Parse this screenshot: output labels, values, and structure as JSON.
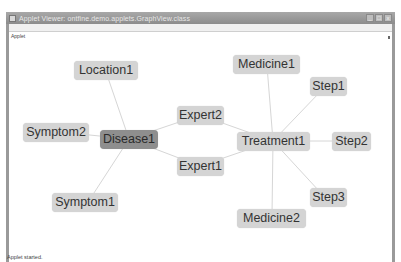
{
  "window": {
    "title": "Applet Viewer: ontfine.demo.applets.GraphView.class",
    "controls": {
      "minimize": "_",
      "maximize": "□",
      "close": "x"
    }
  },
  "menubar": {
    "items": [
      {
        "label": "Applet"
      }
    ]
  },
  "graph": {
    "nodes": [
      {
        "id": "location1",
        "label": "Location1",
        "x": 74,
        "y": 61,
        "w": 64,
        "style": "light"
      },
      {
        "id": "medicine1",
        "label": "Medicine1",
        "x": 233,
        "y": 55,
        "w": 67,
        "style": "light"
      },
      {
        "id": "step1",
        "label": "Step1",
        "x": 310,
        "y": 77,
        "w": 37,
        "style": "light"
      },
      {
        "id": "expert2",
        "label": "Expert2",
        "x": 177,
        "y": 106,
        "w": 47,
        "style": "light"
      },
      {
        "id": "symptom2",
        "label": "Symptom2",
        "x": 23,
        "y": 123,
        "w": 66,
        "style": "light"
      },
      {
        "id": "disease1",
        "label": "Disease1",
        "x": 100,
        "y": 130,
        "w": 58,
        "style": "dark"
      },
      {
        "id": "treatment1",
        "label": "Treatment1",
        "x": 237,
        "y": 132,
        "w": 73,
        "style": "light"
      },
      {
        "id": "step2",
        "label": "Step2",
        "x": 332,
        "y": 132,
        "w": 39,
        "style": "light"
      },
      {
        "id": "expert1",
        "label": "Expert1",
        "x": 177,
        "y": 157,
        "w": 47,
        "style": "light"
      },
      {
        "id": "symptom1",
        "label": "Symptom1",
        "x": 52,
        "y": 193,
        "w": 66,
        "style": "light"
      },
      {
        "id": "step3",
        "label": "Step3",
        "x": 310,
        "y": 188,
        "w": 37,
        "style": "light"
      },
      {
        "id": "medicine2",
        "label": "Medicine2",
        "x": 237,
        "y": 209,
        "w": 69,
        "style": "light"
      }
    ],
    "edges": [
      {
        "from": "disease1",
        "to": "location1",
        "x1": 129,
        "y1": 139,
        "x2": 106,
        "y2": 72
      },
      {
        "from": "disease1",
        "to": "symptom2",
        "x1": 129,
        "y1": 139,
        "x2": 70,
        "y2": 133
      },
      {
        "from": "disease1",
        "to": "symptom1",
        "x1": 129,
        "y1": 139,
        "x2": 92,
        "y2": 196
      },
      {
        "from": "disease1",
        "to": "expert2",
        "x1": 129,
        "y1": 139,
        "x2": 200,
        "y2": 115
      },
      {
        "from": "disease1",
        "to": "expert1",
        "x1": 129,
        "y1": 139,
        "x2": 200,
        "y2": 166
      },
      {
        "from": "expert2",
        "to": "treatment1",
        "x1": 200,
        "y1": 115,
        "x2": 273,
        "y2": 141
      },
      {
        "from": "expert1",
        "to": "treatment1",
        "x1": 200,
        "y1": 166,
        "x2": 273,
        "y2": 141
      },
      {
        "from": "treatment1",
        "to": "medicine1",
        "x1": 273,
        "y1": 141,
        "x2": 267,
        "y2": 66
      },
      {
        "from": "treatment1",
        "to": "step1",
        "x1": 273,
        "y1": 141,
        "x2": 320,
        "y2": 92
      },
      {
        "from": "treatment1",
        "to": "step2",
        "x1": 273,
        "y1": 141,
        "x2": 350,
        "y2": 141
      },
      {
        "from": "treatment1",
        "to": "step3",
        "x1": 273,
        "y1": 141,
        "x2": 320,
        "y2": 192
      },
      {
        "from": "treatment1",
        "to": "medicine2",
        "x1": 273,
        "y1": 141,
        "x2": 272,
        "y2": 215
      }
    ],
    "colors": {
      "edge": "#d6d6d6",
      "node": "#d4d4d4",
      "node_selected": "#8e8e8e"
    }
  },
  "status": {
    "text": "Applet started."
  }
}
